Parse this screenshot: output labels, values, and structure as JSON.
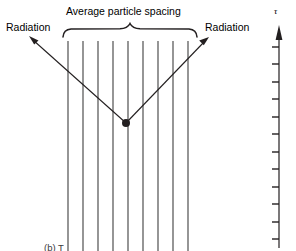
{
  "figure": {
    "title_label": "Average particle spacing",
    "radiation_left_label": "Radiation",
    "radiation_right_label": "Radiation",
    "tau_axis_label": "τ",
    "bottom_cut_label": "(b) T",
    "colors": {
      "line": "#231f20",
      "background": "#ffffff",
      "particle_line": "#3f3f3f",
      "axis": "#231f20"
    },
    "geometry": {
      "particle_lines_x": [
        68,
        83,
        98,
        113,
        128,
        143,
        158,
        173,
        188
      ],
      "particle_line_top": 41,
      "particle_line_bottom": 251,
      "brace_left_x": 63,
      "brace_right_x": 197,
      "brace_y": 36,
      "brace_peak_x": 130,
      "vertex_x": 126,
      "vertex_y": 123,
      "arrow_left_tip_x": 29,
      "arrow_left_tip_y": 36,
      "arrow_right_tip_x": 209,
      "arrow_right_tip_y": 37,
      "axis_x": 279,
      "axis_top_y": 28,
      "axis_bottom_y": 248,
      "tick_count": 12,
      "tick_spacing": 17.5,
      "tick_length": 7
    }
  }
}
